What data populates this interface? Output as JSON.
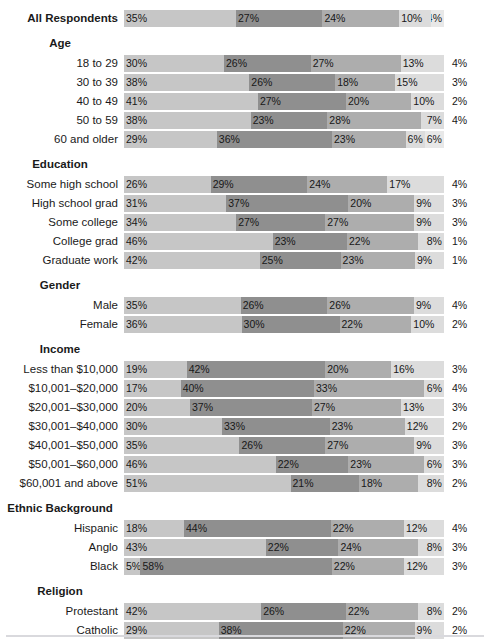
{
  "colors": {
    "republican": "#c6c6c6",
    "democrat": "#8f8f8f",
    "independent": "#adadad",
    "other": "#dcdcdc",
    "dont_know": "#e8e8e8",
    "text": "#171717",
    "footer_rule": "#d9d9dd"
  },
  "legend": {
    "items": [
      {
        "label": "Republican",
        "color_key": "republican"
      },
      {
        "label": "Democrat",
        "color_key": "democrat"
      },
      {
        "label": "Independent",
        "color_key": "independent"
      },
      {
        "label": "Other",
        "color_key": "other"
      },
      {
        "label": "Don't Know",
        "color_key": "dont_know"
      }
    ]
  },
  "chart_data": {
    "type": "bar",
    "subtype": "stacked-horizontal-100pct",
    "title": "",
    "xlabel": "",
    "ylabel": "",
    "xlim": [
      0,
      100
    ],
    "grid": false,
    "legend_position": "bottom",
    "series": [
      {
        "name": "Republican"
      },
      {
        "name": "Democrat"
      },
      {
        "name": "Independent"
      },
      {
        "name": "Other"
      },
      {
        "name": "Don't Know"
      }
    ],
    "groups": [
      {
        "header": "",
        "rows": [
          {
            "label": "All Respondents",
            "bold": true,
            "values": [
              35,
              27,
              24,
              10,
              4
            ],
            "labels": [
              "35%",
              "27%",
              "24%",
              "10%",
              "4%"
            ],
            "last_outside": false
          }
        ]
      },
      {
        "header": "Age",
        "rows": [
          {
            "label": "18 to 29",
            "bold": false,
            "values": [
              30,
              26,
              27,
              13,
              4
            ],
            "labels": [
              "30%",
              "26%",
              "27%",
              "13%",
              "4%"
            ],
            "last_outside": true
          },
          {
            "label": "30 to 39",
            "bold": false,
            "values": [
              38,
              26,
              18,
              15,
              3
            ],
            "labels": [
              "38%",
              "26%",
              "18%",
              "15%",
              "3%"
            ],
            "last_outside": true
          },
          {
            "label": "40 to 49",
            "bold": false,
            "values": [
              41,
              27,
              20,
              10,
              2
            ],
            "labels": [
              "41%",
              "27%",
              "20%",
              "10%",
              "2%"
            ],
            "last_outside": true
          },
          {
            "label": "50 to 59",
            "bold": false,
            "values": [
              38,
              23,
              28,
              7,
              4
            ],
            "labels": [
              "38%",
              "23%",
              "28%",
              "7%",
              "4%"
            ],
            "last_outside": true
          },
          {
            "label": "60 and older",
            "bold": false,
            "values": [
              29,
              36,
              23,
              6,
              6
            ],
            "labels": [
              "29%",
              "36%",
              "23%",
              "6%",
              "6%"
            ],
            "last_outside": false
          }
        ]
      },
      {
        "header": "Education",
        "rows": [
          {
            "label": "Some high school",
            "bold": false,
            "values": [
              26,
              29,
              24,
              17,
              4
            ],
            "labels": [
              "26%",
              "29%",
              "24%",
              "17%",
              "4%"
            ],
            "last_outside": true
          },
          {
            "label": "High school grad",
            "bold": false,
            "values": [
              31,
              37,
              20,
              9,
              3
            ],
            "labels": [
              "31%",
              "37%",
              "20%",
              "9%",
              "3%"
            ],
            "last_outside": true
          },
          {
            "label": "Some college",
            "bold": false,
            "values": [
              34,
              27,
              27,
              9,
              3
            ],
            "labels": [
              "34%",
              "27%",
              "27%",
              "9%",
              "3%"
            ],
            "last_outside": true
          },
          {
            "label": "College grad",
            "bold": false,
            "values": [
              46,
              23,
              22,
              8,
              1
            ],
            "labels": [
              "46%",
              "23%",
              "22%",
              "8%",
              "1%"
            ],
            "last_outside": true
          },
          {
            "label": "Graduate work",
            "bold": false,
            "values": [
              42,
              25,
              23,
              9,
              1
            ],
            "labels": [
              "42%",
              "25%",
              "23%",
              "9%",
              "1%"
            ],
            "last_outside": true
          }
        ]
      },
      {
        "header": "Gender",
        "rows": [
          {
            "label": "Male",
            "bold": false,
            "values": [
              35,
              26,
              26,
              9,
              4
            ],
            "labels": [
              "35%",
              "26%",
              "26%",
              "9%",
              "4%"
            ],
            "last_outside": true
          },
          {
            "label": "Female",
            "bold": false,
            "values": [
              36,
              30,
              22,
              10,
              2
            ],
            "labels": [
              "36%",
              "30%",
              "22%",
              "10%",
              "2%"
            ],
            "last_outside": true
          }
        ]
      },
      {
        "header": "Income",
        "rows": [
          {
            "label": "Less than $10,000",
            "bold": false,
            "values": [
              19,
              42,
              20,
              16,
              3
            ],
            "labels": [
              "19%",
              "42%",
              "20%",
              "16%",
              "3%"
            ],
            "last_outside": true
          },
          {
            "label": "$10,001–$20,000",
            "bold": false,
            "values": [
              17,
              40,
              33,
              6,
              4
            ],
            "labels": [
              "17%",
              "40%",
              "33%",
              "6%",
              "4%"
            ],
            "last_outside": true
          },
          {
            "label": "$20,001–$30,000",
            "bold": false,
            "values": [
              20,
              37,
              27,
              13,
              3
            ],
            "labels": [
              "20%",
              "37%",
              "27%",
              "13%",
              "3%"
            ],
            "last_outside": true
          },
          {
            "label": "$30,001–$40,000",
            "bold": false,
            "values": [
              30,
              33,
              23,
              12,
              2
            ],
            "labels": [
              "30%",
              "33%",
              "23%",
              "12%",
              "2%"
            ],
            "last_outside": true
          },
          {
            "label": "$40,001–$50,000",
            "bold": false,
            "values": [
              35,
              26,
              27,
              9,
              3
            ],
            "labels": [
              "35%",
              "26%",
              "27%",
              "9%",
              "3%"
            ],
            "last_outside": true
          },
          {
            "label": "$50,001–$60,000",
            "bold": false,
            "values": [
              46,
              22,
              23,
              6,
              3
            ],
            "labels": [
              "46%",
              "22%",
              "23%",
              "6%",
              "3%"
            ],
            "last_outside": true
          },
          {
            "label": "$60,001 and above",
            "bold": false,
            "values": [
              51,
              21,
              18,
              8,
              2
            ],
            "labels": [
              "51%",
              "21%",
              "18%",
              "8%",
              "2%"
            ],
            "last_outside": true
          }
        ]
      },
      {
        "header": "Ethnic Background",
        "rows": [
          {
            "label": "Hispanic",
            "bold": false,
            "values": [
              18,
              44,
              22,
              12,
              4
            ],
            "labels": [
              "18%",
              "44%",
              "22%",
              "12%",
              "4%"
            ],
            "last_outside": true
          },
          {
            "label": "Anglo",
            "bold": false,
            "values": [
              43,
              22,
              24,
              8,
              3
            ],
            "labels": [
              "43%",
              "22%",
              "24%",
              "8%",
              "3%"
            ],
            "last_outside": true
          },
          {
            "label": "Black",
            "bold": false,
            "values": [
              5,
              58,
              22,
              12,
              3
            ],
            "labels": [
              "5%",
              "58%",
              "22%",
              "12%",
              "3%"
            ],
            "last_outside": true
          }
        ]
      },
      {
        "header": "Religion",
        "rows": [
          {
            "label": "Protestant",
            "bold": false,
            "values": [
              42,
              26,
              22,
              8,
              2
            ],
            "labels": [
              "42%",
              "26%",
              "22%",
              "8%",
              "2%"
            ],
            "last_outside": true
          },
          {
            "label": "Catholic",
            "bold": false,
            "values": [
              29,
              38,
              22,
              9,
              2
            ],
            "labels": [
              "29%",
              "38%",
              "22%",
              "9%",
              "2%"
            ],
            "last_outside": true
          }
        ]
      }
    ]
  }
}
